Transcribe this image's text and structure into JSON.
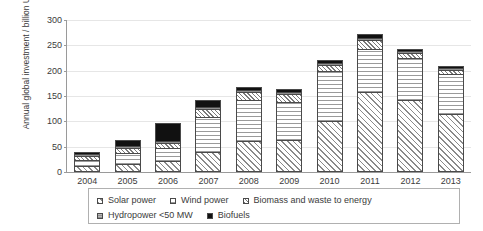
{
  "chart_data": {
    "type": "bar",
    "stacked": true,
    "title": "",
    "subtitle": "",
    "xlabel": "",
    "ylabel": "Annual global investment / billion USD",
    "ylim": [
      0,
      300
    ],
    "ytick_values": [
      0,
      50,
      100,
      150,
      200,
      250,
      300
    ],
    "ytick_labels": [
      "0",
      "50",
      "100",
      "150",
      "200",
      "250",
      "300"
    ],
    "grid": true,
    "grid_axis": "y",
    "legend_position": "bottom",
    "categories": [
      "2004",
      "2005",
      "2006",
      "2007",
      "2008",
      "2009",
      "2010",
      "2011",
      "2012",
      "2013"
    ],
    "series": [
      {
        "name": "Solar power",
        "pattern": "diagonal-hatch",
        "values": [
          11,
          15,
          21,
          40,
          62,
          63,
          100,
          157,
          142,
          114
        ]
      },
      {
        "name": "Wind power",
        "pattern": "horizontal-lines",
        "values": [
          13,
          23,
          27,
          69,
          80,
          76,
          100,
          85,
          83,
          79
        ]
      },
      {
        "name": "Biomass and waste to energy",
        "pattern": "fine-diagonal-hatch",
        "values": [
          7,
          9,
          9,
          16,
          16,
          15,
          12,
          18,
          10,
          9
        ]
      },
      {
        "name": "Hydropower <50 MW",
        "pattern": "gray-fill",
        "values": [
          4,
          4,
          4,
          4,
          4,
          4,
          4,
          5,
          4,
          4
        ]
      },
      {
        "name": "Biofuels",
        "pattern": "solid-black",
        "values": [
          5,
          13,
          36,
          14,
          6,
          5,
          6,
          7,
          4,
          4
        ]
      }
    ],
    "totals": [
      40,
      64,
      97,
      143,
      168,
      163,
      222,
      272,
      243,
      210
    ]
  },
  "legend": {
    "row1": [
      {
        "label": "Solar power",
        "swatch": "solar-swatch"
      },
      {
        "label": "Wind power",
        "swatch": "wind-swatch"
      },
      {
        "label": "Biomass and waste to energy",
        "swatch": "biomass-swatch"
      }
    ],
    "row2": [
      {
        "label": "Hydropower <50 MW",
        "swatch": "hydro-swatch"
      },
      {
        "label": "Biofuels",
        "swatch": "biofuels-swatch"
      }
    ]
  }
}
